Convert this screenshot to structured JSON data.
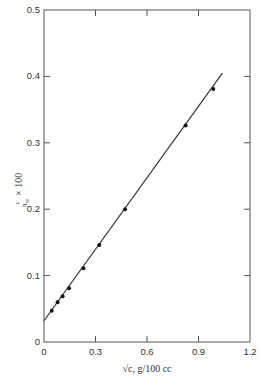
{
  "chart_data": {
    "type": "scatter",
    "title": "",
    "xlabel": "√c, g/100 cc",
    "ylabel": "c/η_sp × 100",
    "ylabel_parts": {
      "numerator": "c",
      "denominator": "η",
      "subscript": "sp",
      "suffix": "× 100"
    },
    "xlim": [
      0,
      1.2
    ],
    "ylim": [
      0,
      0.5
    ],
    "x_ticks": [
      0,
      0.3,
      0.6,
      0.9,
      1.2
    ],
    "x_tick_labels": [
      "0",
      "0.3",
      "0.6",
      "0.9",
      "1.2"
    ],
    "y_ticks": [
      0,
      0.1,
      0.2,
      0.3,
      0.4,
      0.5
    ],
    "y_tick_labels": [
      "0",
      "0.1",
      "0.2",
      "0.3",
      "0.4",
      "0.5"
    ],
    "grid": false,
    "legend": null,
    "series": [
      {
        "name": "measured",
        "type": "scatter",
        "x": [
          0.045,
          0.079,
          0.108,
          0.146,
          0.229,
          0.322,
          0.472,
          0.825,
          0.986
        ],
        "y": [
          0.047,
          0.06,
          0.069,
          0.081,
          0.111,
          0.146,
          0.2,
          0.326,
          0.381
        ]
      },
      {
        "name": "linear fit",
        "type": "line",
        "x": [
          0,
          1.039
        ],
        "y": [
          0.032,
          0.405
        ]
      }
    ]
  },
  "colors": {
    "axis": "#555555",
    "line": "#333333",
    "marker": "#111111"
  }
}
